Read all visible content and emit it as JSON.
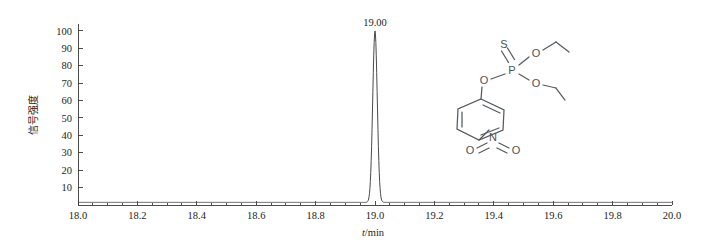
{
  "figure": {
    "background_color": "#ffffff",
    "axis_color": "#3a3a3a",
    "trace_color": "#4a4a4a",
    "structure_color": "#555a5e"
  },
  "chart_data": {
    "type": "line",
    "title": "",
    "subtitle": "",
    "xlabel": "t/min",
    "xlabel_italic_part": "t",
    "xlabel_rest": "/min",
    "ylabel": "信号强度",
    "xlim": [
      18.0,
      20.0
    ],
    "ylim": [
      0,
      104
    ],
    "grid": false,
    "legend": false,
    "x_ticks": [
      "18.0",
      "18.2",
      "18.4",
      "18.6",
      "18.8",
      "19.0",
      "19.2",
      "19.4",
      "19.6",
      "19.8",
      "20.0"
    ],
    "x_tick_values": [
      18.0,
      18.2,
      18.4,
      18.6,
      18.8,
      19.0,
      19.2,
      19.4,
      19.6,
      19.8,
      20.0
    ],
    "x_minor_step": 0.05,
    "y_ticks": [
      "10",
      "20",
      "30",
      "40",
      "50",
      "60",
      "70",
      "80",
      "90",
      "100"
    ],
    "y_tick_values": [
      10,
      20,
      30,
      40,
      50,
      60,
      70,
      80,
      90,
      100
    ],
    "peaks": [
      {
        "label": "19.00",
        "retention_time": 19.0,
        "height": 100,
        "width_half_max": 0.018
      }
    ],
    "baseline": 1.5,
    "series": [
      {
        "name": "chromatogram",
        "x": [
          18.0,
          18.5,
          18.85,
          18.9,
          18.93,
          18.95,
          18.96,
          18.97,
          18.98,
          18.99,
          19.0,
          19.01,
          19.02,
          19.03,
          19.04,
          19.05,
          19.07,
          19.1,
          19.15,
          19.5,
          20.0
        ],
        "y": [
          1.5,
          1.5,
          1.6,
          2.0,
          3.5,
          9.0,
          17.0,
          34.0,
          62.0,
          89.0,
          100.0,
          89.0,
          62.0,
          34.0,
          17.0,
          9.0,
          3.5,
          2.0,
          1.6,
          1.5,
          1.5
        ]
      }
    ]
  },
  "structure": {
    "name": "parathion-structure",
    "compound": "O,O-diethyl O-(4-nitrophenyl) phosphorothioate",
    "atom_labels": {
      "sulfur": "S",
      "phosphorus": "P",
      "oxygen": "O",
      "nitrogen": "N"
    },
    "atoms": [
      {
        "id": "S",
        "label": "S",
        "x": 504,
        "y": 44
      },
      {
        "id": "P",
        "label": "P",
        "x": 512,
        "y": 70
      },
      {
        "id": "O_aryl",
        "label": "O",
        "x": 484,
        "y": 80
      },
      {
        "id": "O_et1",
        "label": "O",
        "x": 536,
        "y": 53
      },
      {
        "id": "O_et2",
        "label": "O",
        "x": 536,
        "y": 83
      },
      {
        "id": "N",
        "label": "N",
        "x": 493,
        "y": 137
      },
      {
        "id": "O_n1",
        "label": "O",
        "x": 470,
        "y": 150
      },
      {
        "id": "O_n2",
        "label": "O",
        "x": 516,
        "y": 150
      }
    ]
  }
}
